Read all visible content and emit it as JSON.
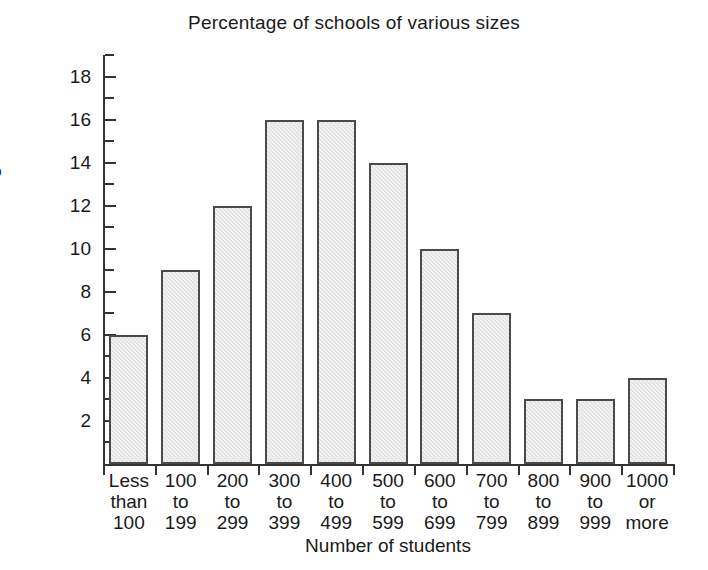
{
  "chart_data": {
    "type": "bar",
    "title": "Percentage of schools of various sizes",
    "xlabel": "Number of students",
    "ylabel": "Percentage",
    "categories": [
      "Less than 100",
      "100 to 199",
      "200 to 299",
      "300 to 399",
      "400 to 499",
      "500 to 599",
      "600 to 699",
      "700 to 799",
      "800 to 899",
      "900 to 999",
      "1000 or more"
    ],
    "category_lines": [
      [
        "Less",
        "than",
        "100"
      ],
      [
        "100",
        "to",
        "199"
      ],
      [
        "200",
        "to",
        "299"
      ],
      [
        "300",
        "to",
        "399"
      ],
      [
        "400",
        "to",
        "499"
      ],
      [
        "500",
        "to",
        "599"
      ],
      [
        "600",
        "to",
        "699"
      ],
      [
        "700",
        "to",
        "799"
      ],
      [
        "800",
        "to",
        "899"
      ],
      [
        "900",
        "to",
        "999"
      ],
      [
        "1000",
        "or",
        "more"
      ]
    ],
    "values": [
      6,
      9,
      12,
      16,
      16,
      14,
      10,
      7,
      3,
      3,
      4
    ],
    "ylim": [
      0,
      19
    ],
    "ytick_labels": [
      "2",
      "4",
      "6",
      "8",
      "10",
      "12",
      "14",
      "16",
      "18"
    ],
    "ytick_values": [
      2,
      4,
      6,
      8,
      10,
      12,
      14,
      16,
      18
    ],
    "yminor_values": [
      1,
      3,
      5,
      7,
      9,
      11,
      13,
      15,
      17,
      19
    ],
    "grid": false,
    "legend": null,
    "bar_fill_color": "#e2e2e2",
    "bar_border_color": "#4a4a4a",
    "axis_color": "#333333",
    "background_color": "#ffffff"
  }
}
